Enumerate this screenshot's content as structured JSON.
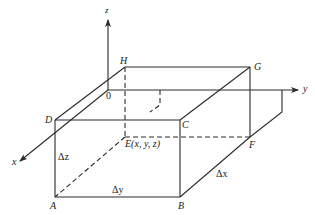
{
  "diagram": {
    "type": "3d-rectangular-box-element",
    "colors": {
      "line": "#2a2a2a",
      "background": "#ffffff"
    },
    "axes": {
      "x": {
        "label": "x"
      },
      "y": {
        "label": "y"
      },
      "z": {
        "label": "z"
      },
      "origin": {
        "label": "0"
      }
    },
    "vertices": {
      "A": "A",
      "B": "B",
      "C": "C",
      "D": "D",
      "E": "E(x, y, z)",
      "F": "F",
      "G": "G",
      "H": "H"
    },
    "dimensions": {
      "dx": "Δx",
      "dy": "Δy",
      "dz": "Δz"
    }
  }
}
